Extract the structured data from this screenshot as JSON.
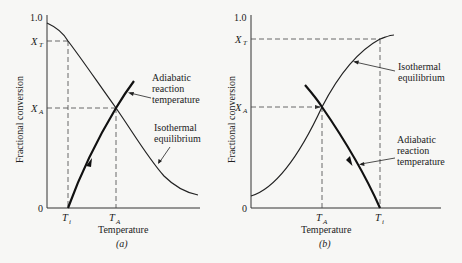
{
  "figure": {
    "background": "#f7f7f5",
    "ink": "#222222"
  },
  "panels": [
    {
      "id": "a",
      "caption": "(a)",
      "y_axis_label": "Fractional conversion",
      "x_axis_label": "Temperature",
      "y_ticks": {
        "top": "1.0",
        "bottom": "0"
      },
      "y_markers": {
        "xt_main": "X",
        "xt_sub": "T",
        "xa_main": "X",
        "xa_sub": "A"
      },
      "x_markers": {
        "ti_main": "T",
        "ti_sub": "i",
        "ta_main": "T",
        "ta_sub": "A"
      },
      "annotations": {
        "adiabatic": [
          "Adiabatic",
          "reaction",
          "temperature"
        ],
        "isothermal": [
          "Isothermal",
          "equilibrium"
        ]
      }
    },
    {
      "id": "b",
      "caption": "(b)",
      "y_axis_label": "Fractional conversion",
      "x_axis_label": "Temperature",
      "y_ticks": {
        "top": "1.0",
        "bottom": "0"
      },
      "y_markers": {
        "xt_main": "X",
        "xt_sub": "T",
        "xa_main": "X",
        "xa_sub": "A"
      },
      "x_markers": {
        "ta_main": "T",
        "ta_sub": "A",
        "ti_main": "T",
        "ti_sub": "i"
      },
      "annotations": {
        "isothermal": [
          "Isothermal",
          "equilibrium"
        ],
        "adiabatic": [
          "Adiabatic",
          "reaction",
          "temperature"
        ]
      }
    }
  ]
}
